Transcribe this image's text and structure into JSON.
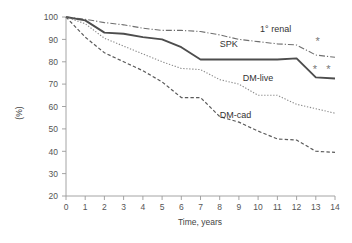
{
  "chart_data": {
    "type": "line",
    "title": "",
    "subtitle": "",
    "xlabel": "Time, years",
    "ylabel": "(%)",
    "xlim": [
      0,
      14
    ],
    "ylim": [
      20,
      100
    ],
    "xticks": [
      "0",
      "1",
      "2",
      "3",
      "4",
      "5",
      "6",
      "7",
      "8",
      "9",
      "10",
      "11",
      "12",
      "13",
      "14"
    ],
    "yticks": [
      "20",
      "30",
      "40",
      "50",
      "60",
      "70",
      "80",
      "90",
      "100"
    ],
    "grid": false,
    "legend_position": "inline-labels",
    "x": [
      0,
      1,
      2,
      3,
      4,
      5,
      6,
      7,
      8,
      9,
      10,
      11,
      12,
      13,
      14
    ],
    "series": [
      {
        "name": "1° renal",
        "style": "dash-dot",
        "color": "#6f6f6f",
        "values": [
          100,
          99,
          97.5,
          96.5,
          95,
          94,
          94,
          93.5,
          92,
          90,
          89,
          88,
          87.5,
          83,
          82
        ],
        "label": "1° renal",
        "label_x": 10.1,
        "label_y": 93.5
      },
      {
        "name": "SPK",
        "style": "solid",
        "color": "#4d4d4d",
        "values": [
          100,
          98.5,
          93,
          92.5,
          91,
          90,
          86.5,
          81,
          81,
          81,
          81,
          81,
          81.5,
          73,
          72.5
        ],
        "label": "SPK",
        "label_x": 8.0,
        "label_y": 86.5
      },
      {
        "name": "DM-live",
        "style": "dotted",
        "color": "#8a8a8a",
        "values": [
          100,
          97,
          90.5,
          87,
          83.5,
          80,
          77,
          76.5,
          72,
          70,
          65,
          65,
          61,
          59,
          57
        ],
        "label": "DM-live",
        "label_x": 9.2,
        "label_y": 71.5
      },
      {
        "name": "DM-cad",
        "style": "dashed",
        "color": "#5a5a5a",
        "values": [
          100,
          91,
          84,
          80,
          76,
          71,
          64,
          64,
          55.5,
          53,
          49,
          45.5,
          45,
          40,
          39.5
        ],
        "label": "DM-cad",
        "label_x": 8.0,
        "label_y": 55.0
      }
    ],
    "annotations": [
      {
        "text": "*",
        "x": 13.1,
        "y": 87.5,
        "note": "significance-mark-renal"
      },
      {
        "text": "*",
        "x": 12.95,
        "y": 75.0,
        "note": "significance-mark-spk-1"
      },
      {
        "text": "*",
        "x": 13.65,
        "y": 75.0,
        "note": "significance-mark-spk-2"
      }
    ]
  }
}
